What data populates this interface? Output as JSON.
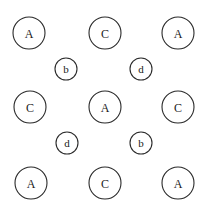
{
  "diagram": {
    "large_nodes": [
      {
        "label": "A",
        "cx": 29,
        "cy": 33
      },
      {
        "label": "C",
        "cx": 105,
        "cy": 33
      },
      {
        "label": "A",
        "cx": 178,
        "cy": 33
      },
      {
        "label": "C",
        "cx": 30,
        "cy": 107
      },
      {
        "label": "A",
        "cx": 105,
        "cy": 107
      },
      {
        "label": "C",
        "cx": 178,
        "cy": 107
      },
      {
        "label": "A",
        "cx": 31,
        "cy": 183
      },
      {
        "label": "C",
        "cx": 105,
        "cy": 183
      },
      {
        "label": "A",
        "cx": 178,
        "cy": 183
      }
    ],
    "small_nodes": [
      {
        "label": "b",
        "cx": 66,
        "cy": 69
      },
      {
        "label": "d",
        "cx": 141,
        "cy": 69
      },
      {
        "label": "d",
        "cx": 67,
        "cy": 143
      },
      {
        "label": "b",
        "cx": 141,
        "cy": 143
      }
    ],
    "large_radius": 16,
    "small_radius": 11,
    "stroke_color": "#2a2a2a"
  }
}
